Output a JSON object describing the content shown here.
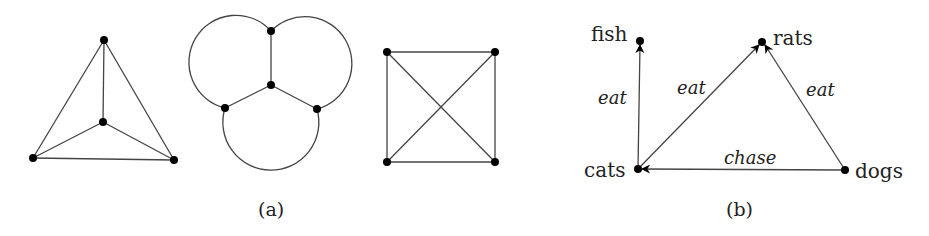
{
  "figure": {
    "part_a": {
      "caption": "(a)",
      "graphs": [
        {
          "name": "k4-planar-triangle",
          "nodes": [
            {
              "id": "top",
              "x": 104,
              "y": 40
            },
            {
              "id": "center",
              "x": 103,
              "y": 122
            },
            {
              "id": "bottom-left",
              "x": 33,
              "y": 158
            },
            {
              "id": "bottom-right",
              "x": 174,
              "y": 160
            }
          ],
          "edges": [
            [
              "top",
              "center"
            ],
            [
              "top",
              "bottom-left"
            ],
            [
              "top",
              "bottom-right"
            ],
            [
              "center",
              "bottom-left"
            ],
            [
              "center",
              "bottom-right"
            ],
            [
              "bottom-left",
              "bottom-right"
            ]
          ]
        },
        {
          "name": "k4-circle-drawing",
          "nodes": [
            {
              "id": "top",
              "x": 271,
              "y": 31
            },
            {
              "id": "center",
              "x": 271,
              "y": 85
            },
            {
              "id": "left",
              "x": 225,
              "y": 108
            },
            {
              "id": "right",
              "x": 317,
              "y": 109
            }
          ]
        },
        {
          "name": "k4-square-crossing",
          "nodes": [
            {
              "id": "top-left",
              "x": 387,
              "y": 52
            },
            {
              "id": "top-right",
              "x": 495,
              "y": 52
            },
            {
              "id": "bottom-left",
              "x": 387,
              "y": 162
            },
            {
              "id": "bottom-right",
              "x": 495,
              "y": 162
            }
          ]
        }
      ]
    },
    "part_b": {
      "caption": "(b)",
      "nodes": {
        "fish": {
          "label": "fish",
          "x": 640,
          "y": 41
        },
        "rats": {
          "label": "rats",
          "x": 762,
          "y": 42
        },
        "cats": {
          "label": "cats",
          "x": 638,
          "y": 169
        },
        "dogs": {
          "label": "dogs",
          "x": 845,
          "y": 170
        }
      },
      "edges": [
        {
          "from": "cats",
          "to": "fish",
          "label": "eat"
        },
        {
          "from": "cats",
          "to": "rats",
          "label": "eat"
        },
        {
          "from": "dogs",
          "to": "rats",
          "label": "eat"
        },
        {
          "from": "dogs",
          "to": "cats",
          "label": "chase"
        }
      ]
    }
  }
}
